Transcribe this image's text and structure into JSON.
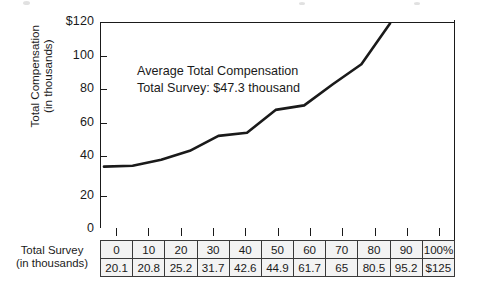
{
  "chart_data": {
    "type": "line",
    "title": "",
    "annotation": [
      "Average Total Compensation",
      "Total Survey: $47.3 thousand"
    ],
    "xlabel": "Total Survey (in thousands)",
    "ylabel": "Total Compensation (in thousands)",
    "ylim": [
      0,
      125
    ],
    "yticks": [
      0,
      20,
      40,
      60,
      80,
      100,
      120
    ],
    "ytick_labels": [
      "0",
      "20",
      "40",
      "60",
      "80",
      "100",
      "$120"
    ],
    "grid": false,
    "legend": null,
    "categories": [
      "0",
      "10",
      "20",
      "30",
      "40",
      "50",
      "60",
      "70",
      "80",
      "90",
      "100%"
    ],
    "values": [
      20.1,
      20.8,
      25.2,
      31.7,
      42.6,
      44.9,
      61.7,
      65,
      80.5,
      95.2,
      125
    ],
    "value_labels": [
      "20.1",
      "20.8",
      "25.2",
      "31.7",
      "42.6",
      "44.9",
      "61.7",
      "65",
      "80.5",
      "95.2",
      "$125"
    ],
    "line_color": "#1a1a1a",
    "line_width": 2.6
  },
  "y_axis": {
    "title_line1": "Total Compensation",
    "title_line2": "(in thousands)",
    "labels": [
      "$120",
      "100",
      "80",
      "60",
      "40",
      "20",
      "0"
    ]
  },
  "x_axis": {
    "title_line1": "Total Survey",
    "title_line2": "(in thousands)"
  },
  "table": {
    "row_percent": [
      "0",
      "10",
      "20",
      "30",
      "40",
      "50",
      "60",
      "70",
      "80",
      "90",
      "100%"
    ],
    "row_values": [
      "20.1",
      "20.8",
      "25.2",
      "31.7",
      "42.6",
      "44.9",
      "61.7",
      "65",
      "80.5",
      "95.2",
      "$125"
    ]
  },
  "annotation": {
    "line1": "Average Total Compensation",
    "line2": "Total Survey: $47.3 thousand"
  },
  "colors": {
    "ink": "#1a1a1a",
    "cell_fill": "#f3f3f3",
    "rule": "#3a3a3a"
  }
}
